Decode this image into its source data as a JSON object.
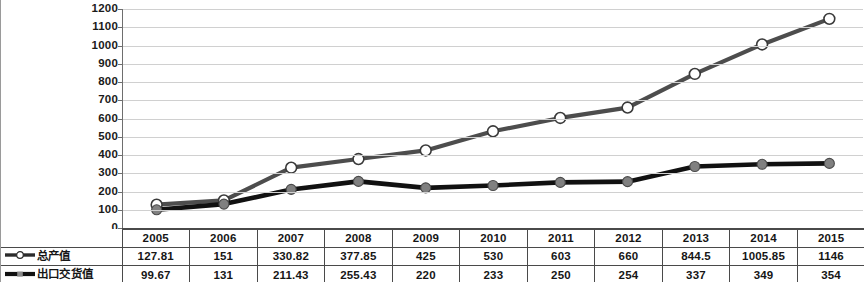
{
  "chart_data": {
    "type": "line",
    "title": "",
    "xlabel": "",
    "ylabel": "",
    "categories": [
      "2005",
      "2006",
      "2007",
      "2008",
      "2009",
      "2010",
      "2011",
      "2012",
      "2013",
      "2014",
      "2015"
    ],
    "ylim": [
      0,
      1200
    ],
    "ytick_step": 100,
    "yticks": [
      "1200",
      "1100",
      "1000",
      "900",
      "800",
      "700",
      "600",
      "500",
      "400",
      "300",
      "200",
      "100",
      "0"
    ],
    "grid": true,
    "legend_position": "table-left",
    "series": [
      {
        "name": "总产值",
        "marker": "open-circle",
        "color": "#4d4d4d",
        "marker_fill": "#ffffff",
        "values": [
          127.81,
          151,
          330.82,
          377.85,
          425,
          530,
          603,
          660,
          844.5,
          1005.85,
          1146
        ],
        "labels": [
          "127.81",
          "151",
          "330.82",
          "377.85",
          "425",
          "530",
          "603",
          "660",
          "844.5",
          "1005.85",
          "1146"
        ]
      },
      {
        "name": "出口交货值",
        "marker": "filled-circle",
        "color": "#111111",
        "marker_fill": "#808080",
        "values": [
          99.67,
          131,
          211.43,
          255.43,
          220,
          233,
          250,
          254,
          337,
          349,
          354
        ],
        "labels": [
          "99.67",
          "131",
          "211.43",
          "255.43",
          "220",
          "233",
          "250",
          "254",
          "337",
          "349",
          "354"
        ]
      }
    ]
  }
}
